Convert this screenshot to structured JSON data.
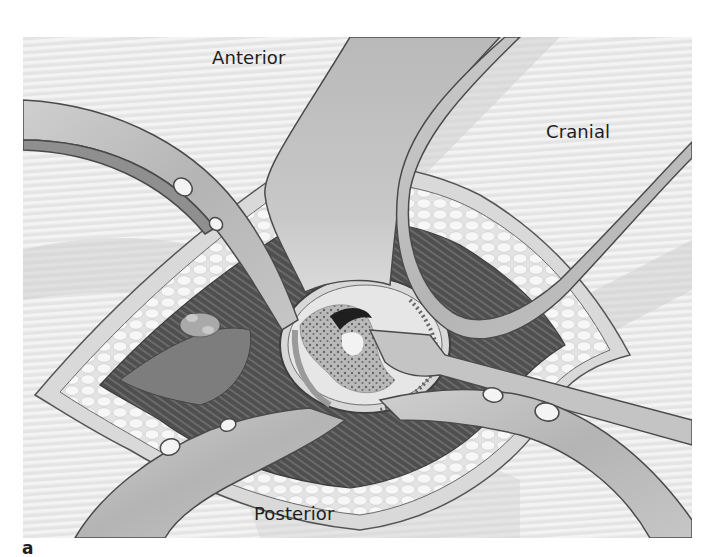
{
  "figure": {
    "panel_label": "a",
    "orientation_labels": {
      "anterior": "Anterior",
      "cranial": "Cranial",
      "posterior": "Posterior"
    },
    "colors": {
      "background_stripe_light": "#f3f3f3",
      "background_stripe_dark": "#e4e4e4",
      "retractor_fill": "#bdbdbd",
      "retractor_outline": "#4a4a4a",
      "fat_tissue": "#efefef",
      "muscle_dark": "#555555",
      "vertebral_body": "#d6d6d6",
      "bone_speckle": "#8a8a8a"
    }
  }
}
